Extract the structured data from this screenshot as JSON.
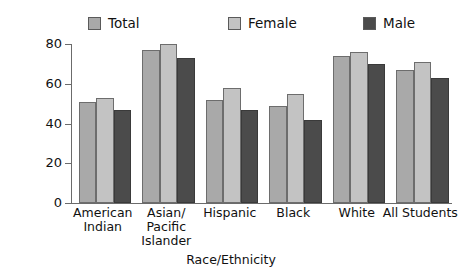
{
  "chart_data": {
    "type": "bar",
    "title": "",
    "xlabel": "Race/Ethnicity",
    "ylabel": "Percent of graduates",
    "ylim": [
      0,
      80
    ],
    "yticks": [
      0,
      20,
      40,
      60,
      80
    ],
    "grid": false,
    "legend_position": "top",
    "categories": [
      "American Indian",
      "Asian/ Pacific Islander",
      "Hispanic",
      "Black",
      "White",
      "All Students"
    ],
    "category_lines": [
      [
        "American",
        "Indian"
      ],
      [
        "Asian/",
        "Pacific",
        "Islander"
      ],
      [
        "Hispanic"
      ],
      [
        "Black"
      ],
      [
        "White"
      ],
      [
        "All Students"
      ]
    ],
    "series": [
      {
        "name": "Total",
        "color": "#a9a9a9",
        "values": [
          51,
          77,
          52,
          49,
          74,
          67
        ]
      },
      {
        "name": "Female",
        "color": "#c3c3c3",
        "values": [
          53,
          80,
          58,
          55,
          76,
          71
        ]
      },
      {
        "name": "Male",
        "color": "#4b4b4b",
        "values": [
          47,
          73,
          47,
          42,
          70,
          63
        ]
      }
    ]
  },
  "axis": {
    "y_tick_labels": [
      "0",
      "20",
      "40",
      "60",
      "80"
    ],
    "y_title": "Percent of graduates",
    "x_title": "Race/Ethnicity"
  },
  "legend": {
    "items": [
      {
        "label": "Total",
        "swatch": "#a9a9a9"
      },
      {
        "label": "Female",
        "swatch": "#c3c3c3"
      },
      {
        "label": "Male",
        "swatch": "#4b4b4b"
      }
    ]
  }
}
